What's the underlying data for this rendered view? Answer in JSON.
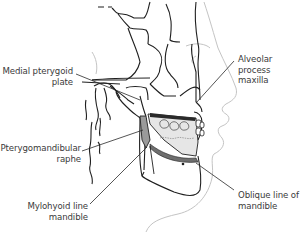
{
  "figure": {
    "colors": {
      "line": "#1f1f1f",
      "soft_tissue": "#c8c8c8",
      "bone_fill": "#e6e6e6",
      "dark_band": "#6e6e6e",
      "label_text": "#3a3a3a"
    },
    "labels": {
      "medial_pterygoid": {
        "line1": "Medial pterygoid",
        "line2": "plate"
      },
      "pterygomandibular": {
        "line1": "Pterygomandibular",
        "line2": "raphe"
      },
      "mylohyoid": {
        "line1": "Mylohyoid line",
        "line2": "mandible"
      },
      "alveolar": {
        "line1": "Alveolar",
        "line2": "process",
        "line3": "maxilla"
      },
      "oblique": {
        "line1": "Oblique line of",
        "line2": "mandible"
      }
    }
  }
}
